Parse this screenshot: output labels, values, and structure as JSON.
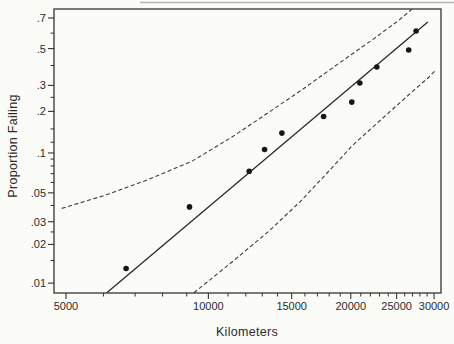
{
  "figure": {
    "background": "#fbfbf8",
    "ink_color": "#333333",
    "point_color": "#161616"
  },
  "chart_data": {
    "type": "scatter",
    "subtype": "weibull-probability-plot-with-fit-and-confidence-bands",
    "title": "",
    "xlabel": "Kilometers",
    "ylabel": "Proportion Failing",
    "x_scale": "log10",
    "y_scale": "weibull ln(-ln(1-p))",
    "xlim": [
      4716,
      31040
    ],
    "ylim": [
      0.0084,
      0.757
    ],
    "grid": false,
    "legend": null,
    "x_ticks_major": [
      5000,
      10000,
      15000,
      20000,
      25000,
      30000
    ],
    "x_tick_labels": [
      "5000",
      "10000",
      "15000",
      "20000",
      "25000",
      "30000"
    ],
    "x_ticks_minor": [
      6000,
      7000,
      8000,
      9000,
      11000,
      12000,
      13000,
      14000,
      16000,
      17000,
      18000,
      19000,
      21000,
      22000,
      23000,
      24000,
      26000,
      27000,
      28000,
      29000
    ],
    "y_ticks_major": [
      0.7,
      0.5,
      0.3,
      0.2,
      0.1,
      0.05,
      0.03,
      0.02,
      0.01
    ],
    "y_tick_labels": [
      ".7",
      ".5",
      ".3",
      ".2",
      ".1",
      ".05",
      ".03",
      ".02",
      ".01"
    ],
    "y_ticks_minor": [
      0.6,
      0.4,
      0.25,
      0.15,
      0.12,
      0.09,
      0.08,
      0.07,
      0.06,
      0.04,
      0.025,
      0.015
    ],
    "points": {
      "km": [
        6700,
        9120,
        12200,
        13150,
        14300,
        17520,
        20100,
        20900,
        22700,
        26510,
        27490
      ],
      "proportion": [
        0.013,
        0.039,
        0.073,
        0.106,
        0.14,
        0.184,
        0.232,
        0.311,
        0.392,
        0.491,
        0.614
      ]
    },
    "fit_line": {
      "km": [
        6100,
        29100
      ],
      "proportion": [
        0.0084,
        0.673
      ]
    },
    "upper_band": {
      "km": [
        4900,
        6050,
        7450,
        9240,
        11220,
        13370,
        15860,
        18800,
        22180,
        25180,
        26940
      ],
      "proportion": [
        0.038,
        0.048,
        0.063,
        0.087,
        0.131,
        0.195,
        0.284,
        0.409,
        0.555,
        0.681,
        0.757
      ]
    },
    "lower_band": {
      "km": [
        9320,
        11220,
        13370,
        15620,
        17900,
        20130,
        22400,
        24680,
        26940,
        29120,
        30280
      ],
      "proportion": [
        0.0084,
        0.0146,
        0.025,
        0.0426,
        0.072,
        0.113,
        0.158,
        0.211,
        0.272,
        0.335,
        0.376
      ]
    }
  }
}
